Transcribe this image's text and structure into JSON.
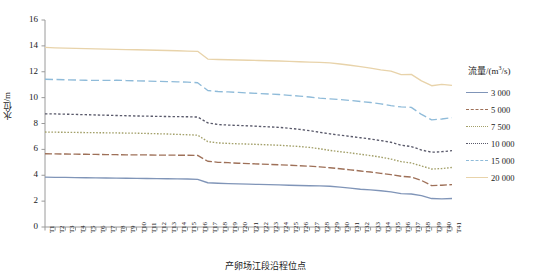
{
  "chart_data": {
    "type": "line",
    "title": "",
    "xlabel": "产卵场江段沿程位点",
    "ylabel": "水位/m",
    "ylim": [
      0,
      16
    ],
    "yticks": [
      0,
      2,
      4,
      6,
      8,
      10,
      12,
      14,
      16
    ],
    "grid": false,
    "legend_position": "right",
    "legend_title": "流量/(m",
    "legend_title_sup": "3",
    "legend_title_tail": "/s)",
    "categories": [
      "T1",
      "T2",
      "T3",
      "T4",
      "T5",
      "T6",
      "T7",
      "T8",
      "T9",
      "T10",
      "T11",
      "T12",
      "T13",
      "T14",
      "T15",
      "T16",
      "T17",
      "T18",
      "T19",
      "T20",
      "T21",
      "T22",
      "T23",
      "T24",
      "T25",
      "T26",
      "T27",
      "T28",
      "T29",
      "T30",
      "T31",
      "T32",
      "T33",
      "T34",
      "T35",
      "T36",
      "T37",
      "T38",
      "T39",
      "T40",
      "T41"
    ],
    "series": [
      {
        "name": "3 000",
        "color": "#8095b8",
        "dash": "solid",
        "values": [
          3.85,
          3.84,
          3.83,
          3.82,
          3.81,
          3.8,
          3.79,
          3.78,
          3.77,
          3.76,
          3.75,
          3.74,
          3.73,
          3.72,
          3.71,
          3.68,
          3.42,
          3.38,
          3.35,
          3.33,
          3.31,
          3.29,
          3.27,
          3.25,
          3.23,
          3.21,
          3.19,
          3.18,
          3.15,
          3.08,
          3.0,
          2.92,
          2.87,
          2.8,
          2.72,
          2.58,
          2.55,
          2.42,
          2.2,
          2.18,
          2.2
        ]
      },
      {
        "name": "5 000",
        "color": "#9e7058",
        "dash": "dashed",
        "values": [
          5.66,
          5.65,
          5.64,
          5.63,
          5.62,
          5.61,
          5.6,
          5.59,
          5.58,
          5.57,
          5.57,
          5.56,
          5.56,
          5.55,
          5.55,
          5.53,
          5.08,
          5.0,
          4.97,
          4.93,
          4.9,
          4.87,
          4.84,
          4.81,
          4.78,
          4.74,
          4.7,
          4.65,
          4.58,
          4.5,
          4.42,
          4.33,
          4.25,
          4.15,
          4.05,
          3.92,
          3.86,
          3.6,
          3.2,
          3.23,
          3.28
        ]
      },
      {
        "name": "7 500",
        "color": "#a3a06a",
        "dash": "fine-dot",
        "values": [
          7.34,
          7.33,
          7.32,
          7.31,
          7.3,
          7.29,
          7.28,
          7.27,
          7.26,
          7.25,
          7.23,
          7.21,
          7.19,
          7.16,
          7.13,
          7.1,
          6.6,
          6.5,
          6.46,
          6.43,
          6.41,
          6.38,
          6.35,
          6.32,
          6.27,
          6.22,
          6.15,
          6.05,
          5.92,
          5.82,
          5.73,
          5.62,
          5.52,
          5.4,
          5.25,
          5.05,
          4.95,
          4.72,
          4.48,
          4.52,
          4.6
        ]
      },
      {
        "name": "10 000",
        "color": "#5a5a6b",
        "dash": "dotted",
        "values": [
          8.75,
          8.74,
          8.72,
          8.7,
          8.68,
          8.66,
          8.64,
          8.62,
          8.6,
          8.58,
          8.57,
          8.55,
          8.54,
          8.53,
          8.52,
          8.5,
          8.05,
          7.92,
          7.88,
          7.85,
          7.82,
          7.78,
          7.74,
          7.7,
          7.63,
          7.55,
          7.45,
          7.32,
          7.2,
          7.1,
          7.0,
          6.9,
          6.8,
          6.68,
          6.55,
          6.32,
          6.22,
          5.95,
          5.78,
          5.82,
          5.9
        ]
      },
      {
        "name": "15 000",
        "color": "#8fbbd9",
        "dash": "long-dash",
        "values": [
          11.42,
          11.4,
          11.38,
          11.36,
          11.34,
          11.33,
          11.33,
          11.34,
          11.32,
          11.3,
          11.28,
          11.26,
          11.24,
          11.22,
          11.2,
          11.15,
          10.55,
          10.47,
          10.44,
          10.4,
          10.36,
          10.32,
          10.28,
          10.24,
          10.18,
          10.12,
          10.05,
          9.96,
          9.9,
          9.85,
          9.78,
          9.7,
          9.62,
          9.52,
          9.38,
          9.28,
          9.25,
          8.7,
          8.28,
          8.35,
          8.45
        ]
      },
      {
        "name": "20 000",
        "color": "#e8d3aa",
        "dash": "solid",
        "values": [
          13.88,
          13.85,
          13.83,
          13.81,
          13.79,
          13.77,
          13.75,
          13.73,
          13.71,
          13.7,
          13.68,
          13.66,
          13.64,
          13.62,
          13.6,
          13.58,
          12.98,
          12.95,
          12.93,
          12.91,
          12.89,
          12.87,
          12.85,
          12.83,
          12.8,
          12.77,
          12.74,
          12.72,
          12.68,
          12.6,
          12.5,
          12.4,
          12.28,
          12.15,
          12.05,
          11.78,
          11.8,
          11.3,
          10.92,
          11.02,
          10.95
        ]
      }
    ]
  }
}
